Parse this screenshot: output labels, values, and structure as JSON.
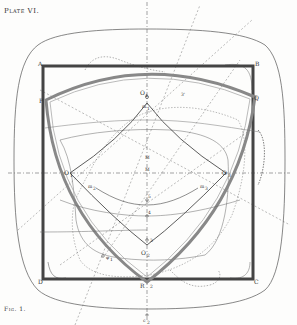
{
  "plate": {
    "title": "Plate VI.",
    "caption": "Fig. 1."
  },
  "colors": {
    "ink": "#333333",
    "thick_frame": "#555555",
    "reuleaux_band": "#888888",
    "paper": "#fdfdfc"
  },
  "labels": {
    "A": "A",
    "B": "B",
    "C": "C",
    "D": "D",
    "P": "P",
    "Q": "Q",
    "R": "R",
    "O1": "O",
    "O1_sub": "1",
    "O2": "O",
    "O2_sub": "2",
    "O3": "O",
    "O3_sub": "3",
    "O_top": "O",
    "O_top_sub": "4",
    "m1": "m",
    "m1_sub": "1",
    "m2": "m",
    "m2_sub": "2",
    "m3": "m",
    "m3_sub": "3",
    "M_upper": "M",
    "M_center": "M",
    "n1": "1",
    "n2": "2",
    "n3": "3",
    "n4": "4",
    "n5": "5",
    "three_prime": "3'",
    "phi1": "φ",
    "phi1_sub": "1",
    "r2": "2",
    "c2": "c",
    "c2_sub": "2"
  }
}
